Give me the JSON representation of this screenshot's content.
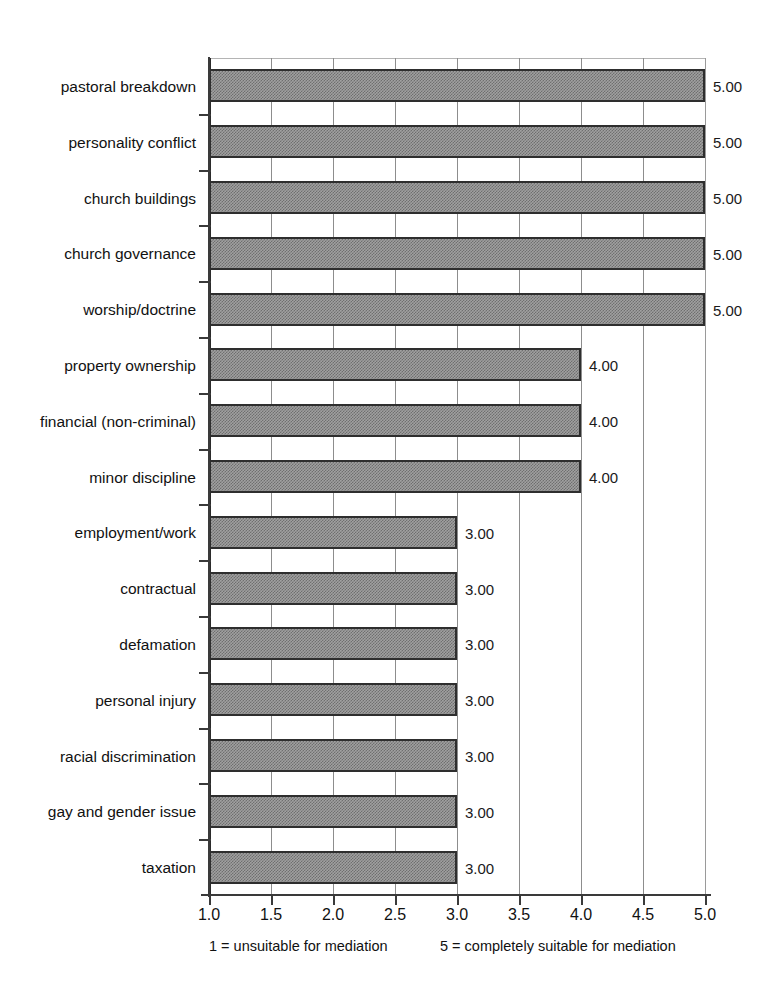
{
  "chart_data": {
    "type": "bar",
    "orientation": "horizontal",
    "title": "",
    "xlabel": "",
    "ylabel": "",
    "xlim": [
      1.0,
      5.0
    ],
    "grid": true,
    "legend": "none",
    "categories": [
      "pastoral breakdown",
      "personality conflict",
      "church buildings",
      "church governance",
      "worship/doctrine",
      "property ownership",
      "financial (non-criminal)",
      "minor discipline",
      "employment/work",
      "contractual",
      "defamation",
      "personal injury",
      "racial discrimination",
      "gay and gender issue",
      "taxation"
    ],
    "values": [
      5.0,
      5.0,
      5.0,
      5.0,
      5.0,
      4.0,
      4.0,
      4.0,
      3.0,
      3.0,
      3.0,
      3.0,
      3.0,
      3.0,
      3.0
    ],
    "value_labels": [
      "5.00",
      "5.00",
      "5.00",
      "5.00",
      "5.00",
      "4.00",
      "4.00",
      "4.00",
      "3.00",
      "3.00",
      "3.00",
      "3.00",
      "3.00",
      "3.00",
      "3.00"
    ],
    "xticks": [
      1.0,
      1.5,
      2.0,
      2.5,
      3.0,
      3.5,
      4.0,
      4.5,
      5.0
    ],
    "xtick_labels": [
      "1.0",
      "1.5",
      "2.0",
      "2.5",
      "3.0",
      "3.5",
      "4.0",
      "4.5",
      "5.0"
    ]
  },
  "caption": {
    "left": "1 = unsuitable for mediation",
    "right": "5 = completely suitable for mediation"
  },
  "colors": {
    "bar_fill": "#a0a0a0",
    "bar_hatch": "#6f6f6f",
    "bar_border": "#2e2e2e",
    "axis": "#3a3a3a",
    "gridline": "#8d8d8d",
    "text": "#111111",
    "background": "#ffffff"
  }
}
